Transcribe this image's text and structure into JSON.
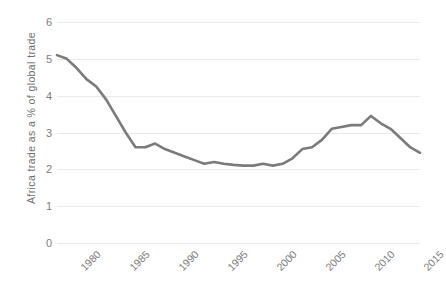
{
  "chart_data": {
    "type": "line",
    "title": "",
    "subtitle": "",
    "xlabel": "",
    "ylabel": "Africa trade as a % of global trade",
    "xlim": [
      1980,
      2017
    ],
    "ylim": [
      0,
      6
    ],
    "grid": true,
    "legend": null,
    "legend_position": "none",
    "y_ticks": [
      6,
      5,
      4,
      3,
      2,
      1,
      0
    ],
    "y_tick_labels": [
      "6",
      "5",
      "4",
      "3",
      "2",
      "1",
      "0"
    ],
    "x_ticks": [
      1980,
      1985,
      1990,
      1995,
      2000,
      2005,
      2010,
      2015
    ],
    "x_tick_labels": [
      "1980",
      "1985",
      "1990",
      "1995",
      "2000",
      "2005",
      "2010",
      "2015"
    ],
    "x": [
      1980,
      1981,
      1982,
      1983,
      1984,
      1985,
      1986,
      1987,
      1988,
      1989,
      1990,
      1991,
      1992,
      1993,
      1994,
      1995,
      1996,
      1997,
      1998,
      1999,
      2000,
      2001,
      2002,
      2003,
      2004,
      2005,
      2006,
      2007,
      2008,
      2009,
      2010,
      2011,
      2012,
      2013,
      2014,
      2015,
      2016,
      2017
    ],
    "series": [
      {
        "name": "Africa trade as a % of global trade",
        "color": "#7b7b7b",
        "values": [
          5.1,
          5.0,
          4.75,
          4.45,
          4.25,
          3.9,
          3.45,
          3.0,
          2.6,
          2.6,
          2.7,
          2.55,
          2.45,
          2.35,
          2.25,
          2.15,
          2.2,
          2.15,
          2.12,
          2.1,
          2.1,
          2.15,
          2.1,
          2.15,
          2.3,
          2.55,
          2.6,
          2.8,
          3.1,
          3.15,
          3.2,
          3.2,
          3.45,
          3.25,
          3.1,
          2.85,
          2.6,
          2.45
        ]
      }
    ],
    "colors": {
      "line": "#7b7b7b",
      "gridline": "#e9e9e9",
      "tick_text": "#7c7c7c",
      "axis_title_text": "#6e6e6e",
      "background": "#ffffff"
    }
  }
}
